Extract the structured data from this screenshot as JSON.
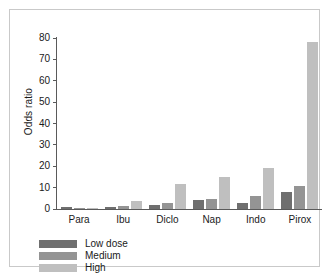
{
  "chart_data": {
    "type": "bar",
    "title": "",
    "xlabel": "",
    "ylabel": "Odds ratio",
    "ylim": [
      0,
      80
    ],
    "yticks": [
      0,
      10,
      20,
      30,
      40,
      50,
      60,
      70,
      80
    ],
    "grid": false,
    "legend_position": "bottom-left",
    "categories": [
      "Para",
      "Ibu",
      "Diclo",
      "Nap",
      "Indo",
      "Pirox"
    ],
    "series": [
      {
        "name": "Low dose",
        "color": "#6f6f6f",
        "values": [
          1.0,
          0.9,
          1.9,
          4.1,
          2.7,
          8.0
        ]
      },
      {
        "name": "Medium",
        "color": "#949494",
        "values": [
          0.5,
          1.4,
          3.0,
          4.9,
          6.2,
          11.0
        ]
      },
      {
        "name": "High",
        "color": "#bfbfbf",
        "values": [
          0.7,
          3.8,
          11.5,
          15.0,
          19.2,
          78.0
        ]
      }
    ]
  },
  "axis": {
    "y_title": "Odds ratio",
    "y_ticks": [
      "80",
      "70",
      "60",
      "50",
      "40",
      "30",
      "20",
      "10",
      "0"
    ],
    "x_ticks": [
      "Para",
      "Ibu",
      "Diclo",
      "Nap",
      "Indo",
      "Pirox"
    ]
  },
  "legend": {
    "items": [
      {
        "label": "Low dose",
        "key": "low"
      },
      {
        "label": "Medium",
        "key": "medium"
      },
      {
        "label": "High",
        "key": "high"
      }
    ]
  }
}
